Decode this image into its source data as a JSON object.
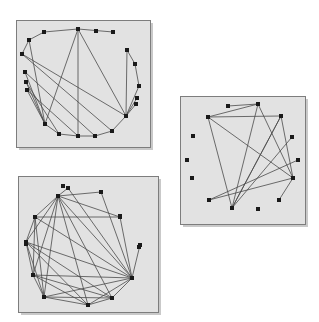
{
  "figure": {
    "width": 319,
    "height": 322,
    "background_color": "#ffffff",
    "panel_fill_color": "#e2e2e2",
    "panel_border_color": "#7d7d7d",
    "panel_shadow_color": "#c9c9c9",
    "node_color": "#1a1a1a",
    "edge_color": "#4a4a4a",
    "node_size": 4,
    "panel_count": 3
  },
  "chart_data": {
    "type": "scatter",
    "xlabel": "",
    "ylabel": "",
    "panels": [
      {
        "name": "panel-top-left",
        "x": 16,
        "y": 20,
        "width": 134,
        "height": 127,
        "node_count": 20,
        "edge_count": 27,
        "nodes": [
          [
            44,
            32
          ],
          [
            78,
            29
          ],
          [
            96,
            31
          ],
          [
            113,
            32
          ],
          [
            29,
            40
          ],
          [
            127,
            50
          ],
          [
            22,
            54
          ],
          [
            135,
            64
          ],
          [
            25,
            72
          ],
          [
            139,
            86
          ],
          [
            26,
            82
          ],
          [
            137,
            98
          ],
          [
            27,
            90
          ],
          [
            45,
            124
          ],
          [
            126,
            116
          ],
          [
            59,
            134
          ],
          [
            78,
            136
          ],
          [
            95,
            136
          ],
          [
            112,
            131
          ],
          [
            136,
            104
          ]
        ],
        "edges": [
          [
            0,
            1
          ],
          [
            0,
            4
          ],
          [
            4,
            6
          ],
          [
            4,
            13
          ],
          [
            1,
            3
          ],
          [
            1,
            13
          ],
          [
            1,
            14
          ],
          [
            1,
            16
          ],
          [
            5,
            7
          ],
          [
            5,
            14
          ],
          [
            7,
            9
          ],
          [
            9,
            14
          ],
          [
            11,
            14
          ],
          [
            6,
            14
          ],
          [
            8,
            13
          ],
          [
            10,
            13
          ],
          [
            12,
            13
          ],
          [
            13,
            15
          ],
          [
            15,
            16
          ],
          [
            16,
            17
          ],
          [
            17,
            18
          ],
          [
            18,
            14
          ],
          [
            14,
            19
          ],
          [
            6,
            18
          ],
          [
            8,
            17
          ],
          [
            10,
            15
          ],
          [
            12,
            16
          ]
        ]
      },
      {
        "name": "panel-right",
        "x": 180,
        "y": 96,
        "width": 125,
        "height": 128,
        "node_count": 14,
        "edge_count": 14,
        "nodes": [
          [
            208,
            117
          ],
          [
            228,
            106
          ],
          [
            258,
            104
          ],
          [
            281,
            116
          ],
          [
            193,
            136
          ],
          [
            292,
            137
          ],
          [
            187,
            160
          ],
          [
            298,
            160
          ],
          [
            192,
            178
          ],
          [
            293,
            178
          ],
          [
            209,
            200
          ],
          [
            279,
            200
          ],
          [
            232,
            208
          ],
          [
            258,
            209
          ]
        ],
        "edges": [
          [
            0,
            2
          ],
          [
            0,
            12
          ],
          [
            0,
            9
          ],
          [
            1,
            2
          ],
          [
            2,
            12
          ],
          [
            2,
            9
          ],
          [
            3,
            12
          ],
          [
            3,
            9
          ],
          [
            0,
            3
          ],
          [
            10,
            7
          ],
          [
            10,
            9
          ],
          [
            12,
            5
          ],
          [
            12,
            3
          ],
          [
            9,
            11
          ]
        ]
      },
      {
        "name": "panel-bottom-left",
        "x": 18,
        "y": 176,
        "width": 140,
        "height": 136,
        "node_count": 16,
        "edge_count": 34,
        "nodes": [
          [
            68,
            188
          ],
          [
            101,
            192
          ],
          [
            58,
            196
          ],
          [
            35,
            217
          ],
          [
            120,
            217
          ],
          [
            26,
            242
          ],
          [
            140,
            245
          ],
          [
            33,
            275
          ],
          [
            132,
            278
          ],
          [
            44,
            297
          ],
          [
            112,
            298
          ],
          [
            88,
            305
          ],
          [
            63,
            186
          ],
          [
            26,
            244
          ],
          [
            120,
            216
          ],
          [
            139,
            247
          ]
        ],
        "edges": [
          [
            2,
            0
          ],
          [
            2,
            1
          ],
          [
            2,
            3
          ],
          [
            2,
            4
          ],
          [
            2,
            5
          ],
          [
            2,
            7
          ],
          [
            2,
            8
          ],
          [
            2,
            9
          ],
          [
            2,
            10
          ],
          [
            2,
            11
          ],
          [
            3,
            4
          ],
          [
            3,
            5
          ],
          [
            3,
            7
          ],
          [
            3,
            8
          ],
          [
            3,
            9
          ],
          [
            5,
            7
          ],
          [
            5,
            8
          ],
          [
            5,
            9
          ],
          [
            5,
            10
          ],
          [
            5,
            11
          ],
          [
            7,
            8
          ],
          [
            7,
            9
          ],
          [
            7,
            10
          ],
          [
            7,
            11
          ],
          [
            9,
            8
          ],
          [
            9,
            10
          ],
          [
            9,
            11
          ],
          [
            10,
            8
          ],
          [
            10,
            11
          ],
          [
            11,
            8
          ],
          [
            1,
            8
          ],
          [
            4,
            8
          ],
          [
            6,
            8
          ],
          [
            0,
            8
          ]
        ]
      }
    ]
  }
}
